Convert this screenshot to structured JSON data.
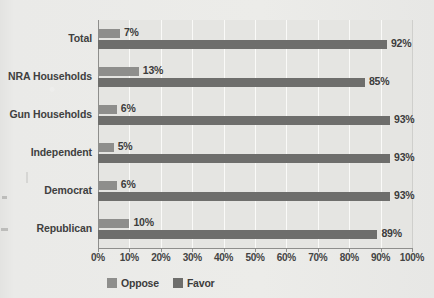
{
  "chart_data": {
    "type": "bar",
    "orientation": "horizontal",
    "title": "",
    "xlabel": "",
    "ylabel": "",
    "xlim": [
      0,
      100
    ],
    "xticks": [
      "0%",
      "10%",
      "20%",
      "30%",
      "40%",
      "50%",
      "60%",
      "70%",
      "80%",
      "90%",
      "100%"
    ],
    "xtick_values": [
      0,
      10,
      20,
      30,
      40,
      50,
      60,
      70,
      80,
      90,
      100
    ],
    "grid": true,
    "grid_axis": "x",
    "legend_position": "bottom-left",
    "categories": [
      "Total",
      "NRA Households",
      "Gun Households",
      "Independent",
      "Democrat",
      "Republican"
    ],
    "series": [
      {
        "name": "Oppose",
        "color": "#8e8e8c",
        "values": [
          7,
          13,
          6,
          5,
          6,
          10
        ],
        "labels": [
          "7%",
          "13%",
          "6%",
          "5%",
          "6%",
          "10%"
        ]
      },
      {
        "name": "Favor",
        "color": "#6e6e6c",
        "values": [
          92,
          85,
          93,
          93,
          93,
          89
        ],
        "labels": [
          "92%",
          "85%",
          "93%",
          "93%",
          "93%",
          "89%"
        ]
      }
    ]
  },
  "legend": {
    "items": [
      {
        "label": "Oppose",
        "swatch": "oppose-swatch"
      },
      {
        "label": "Favor",
        "swatch": "favor-swatch"
      }
    ]
  },
  "colors": {
    "oppose": "#8e8e8c",
    "favor": "#6e6e6c",
    "plot_background": "#e5e5e2",
    "page_background": "#e9e9e7",
    "gridline": "#fafaf8",
    "axis": "#8e8e8c",
    "text": "#3c3c3c"
  }
}
